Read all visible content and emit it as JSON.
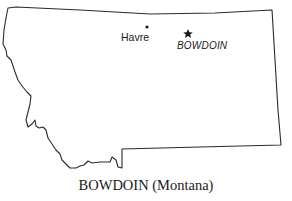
{
  "map": {
    "region": "Montana",
    "outline_color": "#2a2a2a",
    "markers": [
      {
        "name": "Havre",
        "symbol": "dot",
        "x": 147,
        "y": 27
      },
      {
        "name": "BOWDOIN",
        "symbol": "star",
        "x": 188,
        "y": 33
      }
    ]
  },
  "labels": {
    "city": "Havre",
    "town": "BOWDOIN",
    "star_glyph": "★"
  },
  "caption": "BOWDOIN (Montana)"
}
